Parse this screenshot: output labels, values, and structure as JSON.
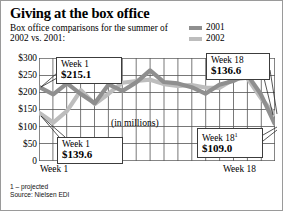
{
  "header": {
    "title": "Giving at the box office",
    "subtitle": "Box office comparisons for the summer of 2002 vs. 2001:"
  },
  "legend": {
    "items": [
      {
        "label": "2001",
        "color": "#8f8f8f"
      },
      {
        "label": "2002",
        "color": "#bdbdbd"
      }
    ]
  },
  "axis": {
    "y_ticks": [
      "$300",
      "$250",
      "$200",
      "$150",
      "$100",
      "$50",
      "0"
    ],
    "x_left": "Week 1",
    "x_right": "Week 18"
  },
  "plot_note": "(in millions)",
  "callouts": [
    {
      "id": "w1-2001",
      "week": "Week 1",
      "value": "$215.1"
    },
    {
      "id": "w1-2002",
      "week": "Week 1",
      "value": "$139.6"
    },
    {
      "id": "w18-2002",
      "week": "Week 18",
      "value": "$136.6"
    },
    {
      "id": "w18-2001",
      "week": "Week 18",
      "sup": "1",
      "value": "$109.0"
    }
  ],
  "footnotes": {
    "projected": "1 – projected",
    "source": "Source: Nielsen EDI"
  },
  "colors": {
    "series_2001": "#8f8f8f",
    "series_2002": "#bdbdbd",
    "grid": "#555555",
    "frame": "#2b2b2b",
    "background": "#ffffff"
  },
  "chart_data": {
    "type": "line",
    "title": "Giving at the box office",
    "subtitle": "Box office comparisons for the summer of 2002 vs. 2001:",
    "xlabel": "",
    "ylabel": "",
    "unit_note": "(in millions)",
    "ylim": [
      0,
      300
    ],
    "yticks": [
      0,
      50,
      100,
      150,
      200,
      250,
      300
    ],
    "grid": true,
    "legend_position": "top-right",
    "categories": [
      "Week 1",
      "Week 2",
      "Week 3",
      "Week 4",
      "Week 5",
      "Week 6",
      "Week 7",
      "Week 8",
      "Week 9",
      "Week 10",
      "Week 11",
      "Week 12",
      "Week 13",
      "Week 14",
      "Week 15",
      "Week 16",
      "Week 17",
      "Week 18"
    ],
    "series": [
      {
        "name": "2001",
        "color": "#8f8f8f",
        "values": [
          215.1,
          194.0,
          226.0,
          195.0,
          168.0,
          223.0,
          204.0,
          229.0,
          264.0,
          230.0,
          226.0,
          215.0,
          196.0,
          222.0,
          233.0,
          253.0,
          195.0,
          109.0
        ]
      },
      {
        "name": "2002",
        "color": "#bdbdbd",
        "values": [
          139.6,
          112.0,
          146.0,
          206.0,
          166.0,
          196.0,
          228.0,
          233.0,
          237.0,
          224.0,
          219.0,
          221.0,
          214.0,
          213.0,
          237.0,
          243.0,
          184.0,
          136.6
        ]
      }
    ],
    "annotations": [
      {
        "series": "2001",
        "category": "Week 1",
        "label": "Week 1",
        "value": "$215.1"
      },
      {
        "series": "2002",
        "category": "Week 1",
        "label": "Week 1",
        "value": "$139.6"
      },
      {
        "series": "2002",
        "category": "Week 18",
        "label": "Week 18",
        "value": "$136.6"
      },
      {
        "series": "2001",
        "category": "Week 18",
        "label": "Week 18¹",
        "value": "$109.0"
      }
    ],
    "footnotes": [
      "1 – projected",
      "Source: Nielsen EDI"
    ]
  }
}
